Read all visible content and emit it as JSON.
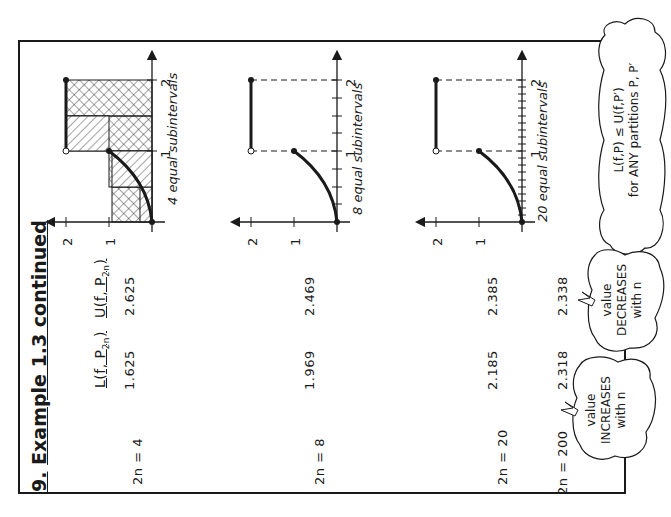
{
  "title": {
    "number": "9.",
    "text": "Example 1.3 continued"
  },
  "table": {
    "headers": {
      "lower": "L(f, P",
      "lower_sub": "2n",
      "upper": "U(f, P",
      "upper_sub": "2n"
    },
    "rows": [
      {
        "n_label": "2n = 4",
        "lower": "1.625",
        "upper": "2.625"
      },
      {
        "n_label": "2n = 8",
        "lower": "1.969",
        "upper": "2.469"
      },
      {
        "n_label": "2n = 20",
        "lower": "2.185",
        "upper": "2.385"
      },
      {
        "n_label": "2n = 200",
        "lower": "2.318",
        "upper": "2.338"
      }
    ]
  },
  "graphs": [
    {
      "caption": "4 equal subintervals",
      "subintervals": 4,
      "y_ticks": [
        "1",
        "2"
      ],
      "x_ticks": [
        "1",
        "2"
      ]
    },
    {
      "caption": "8 equal subintervals",
      "subintervals": 8,
      "y_ticks": [
        "1",
        "2"
      ],
      "x_ticks": [
        "1",
        "2"
      ]
    },
    {
      "caption": "20 equal subintervals",
      "subintervals": 20,
      "y_ticks": [
        "1",
        "2"
      ],
      "x_ticks": [
        "1",
        "2"
      ]
    }
  ],
  "clouds": {
    "increases": {
      "line1": "value",
      "line2": "INCREASES",
      "line3": "with n"
    },
    "decreases": {
      "line1": "value",
      "line2": "DECREASES",
      "line3": "with n"
    },
    "inequality": {
      "line1": "L(f,P) ≤ U(f,P′)",
      "line2": "for ANY partitions P, P′"
    }
  },
  "colors": {
    "ink": "#1a1a1a",
    "paper": "#ffffff",
    "cloud_shadow": "#d8d8d8"
  }
}
